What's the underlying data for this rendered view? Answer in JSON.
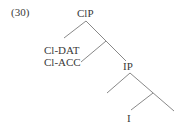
{
  "example_number": "(30)",
  "tree": {
    "root": "ClP",
    "clitics": [
      "Cl-DAT",
      "Cl-ACC"
    ],
    "ip": "IP",
    "head": "I"
  },
  "colors": {
    "line": "#7a7a7a",
    "text": "#3a3a3a"
  }
}
